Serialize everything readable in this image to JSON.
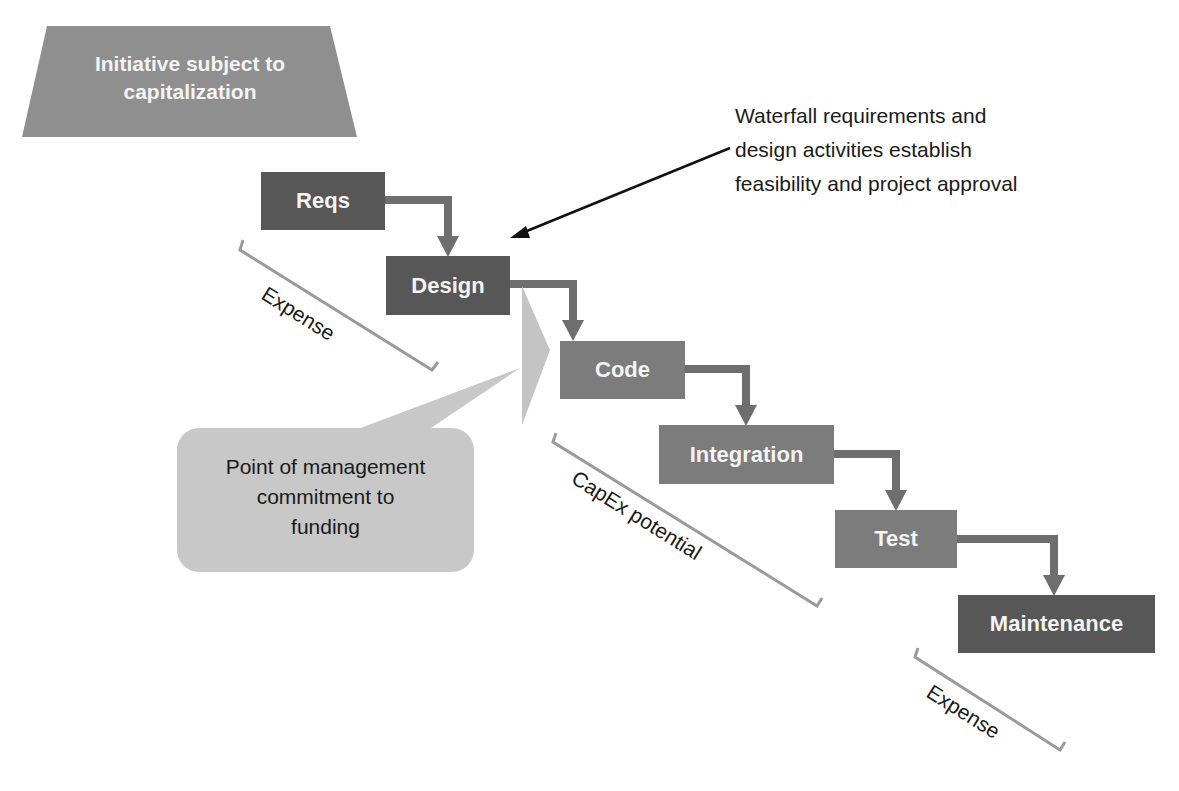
{
  "header": {
    "trapezoid_label": "Initiative subject to capitalization"
  },
  "stages": [
    {
      "label": "Reqs",
      "shade": "dark"
    },
    {
      "label": "Design",
      "shade": "dark"
    },
    {
      "label": "Code",
      "shade": "medium"
    },
    {
      "label": "Integration",
      "shade": "medium"
    },
    {
      "label": "Test",
      "shade": "medium"
    },
    {
      "label": "Maintenance",
      "shade": "dark"
    }
  ],
  "annotations": {
    "waterfall_note": [
      "Waterfall requirements and",
      "design activities establish",
      "feasibility and project approval"
    ],
    "callout": [
      "Point of management",
      "commitment to",
      "funding"
    ],
    "brackets": [
      {
        "label": "Expense"
      },
      {
        "label": "CapEx potential"
      },
      {
        "label": "Expense"
      }
    ]
  },
  "colors": {
    "dark": "#575757",
    "medium": "#7c7c7c",
    "light": "#c4c4c4",
    "bracket": "#9a9a9a"
  }
}
